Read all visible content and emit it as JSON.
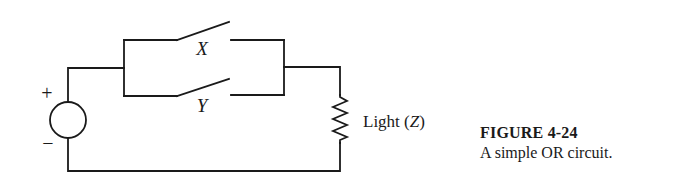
{
  "circuit": {
    "source": {
      "plus_label": "+",
      "minus_label": "−"
    },
    "switches": [
      {
        "id": "X",
        "label": "X"
      },
      {
        "id": "Y",
        "label": "Y"
      }
    ],
    "load": {
      "label_text": "Light (",
      "label_var": "Z",
      "label_close": ")"
    }
  },
  "caption": {
    "title": "FIGURE 4-24",
    "description": "A simple OR circuit."
  },
  "colors": {
    "ink": "#1a1a1a",
    "background": "#ffffff"
  }
}
